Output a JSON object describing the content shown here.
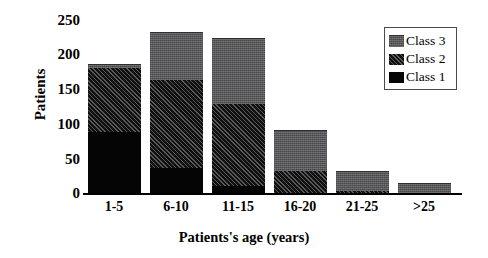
{
  "chart_data": {
    "type": "bar",
    "stacked": true,
    "title": "",
    "xlabel": "Patients's age (years)",
    "ylabel": "Patients",
    "categories": [
      "1-5",
      "6-10",
      "11-15",
      "16-20",
      "21-25",
      ">25"
    ],
    "series": [
      {
        "name": "Class 1",
        "values": [
          87,
          36,
          10,
          0,
          0,
          0
        ],
        "color": "#050505"
      },
      {
        "name": "Class 2",
        "values": [
          92,
          126,
          117,
          32,
          3,
          0
        ],
        "color": "#101010"
      },
      {
        "name": "Class 3",
        "values": [
          5,
          68,
          94,
          58,
          29,
          14
        ],
        "color": "#58585a"
      }
    ],
    "totals": [
      184,
      230,
      221,
      90,
      32,
      14
    ],
    "ylim": [
      0,
      250
    ],
    "yticks": [
      250,
      200,
      150,
      100,
      50,
      0
    ],
    "grid": false,
    "legend_position": "top-right"
  },
  "axes": {
    "y_title": "Patients",
    "x_title": "Patients's age (years)",
    "y_tick_labels": [
      "250",
      "200",
      "150",
      "100",
      "50",
      "0"
    ],
    "x_tick_labels": [
      "1-5",
      "6-10",
      "11-15",
      "16-20",
      "21-25",
      ">25"
    ]
  },
  "legend": {
    "entries": [
      {
        "label": "Class 3",
        "swatch": "grey-texture-swatch"
      },
      {
        "label": "Class 2",
        "swatch": "hatched-swatch"
      },
      {
        "label": "Class 1",
        "swatch": "black-swatch"
      }
    ]
  }
}
